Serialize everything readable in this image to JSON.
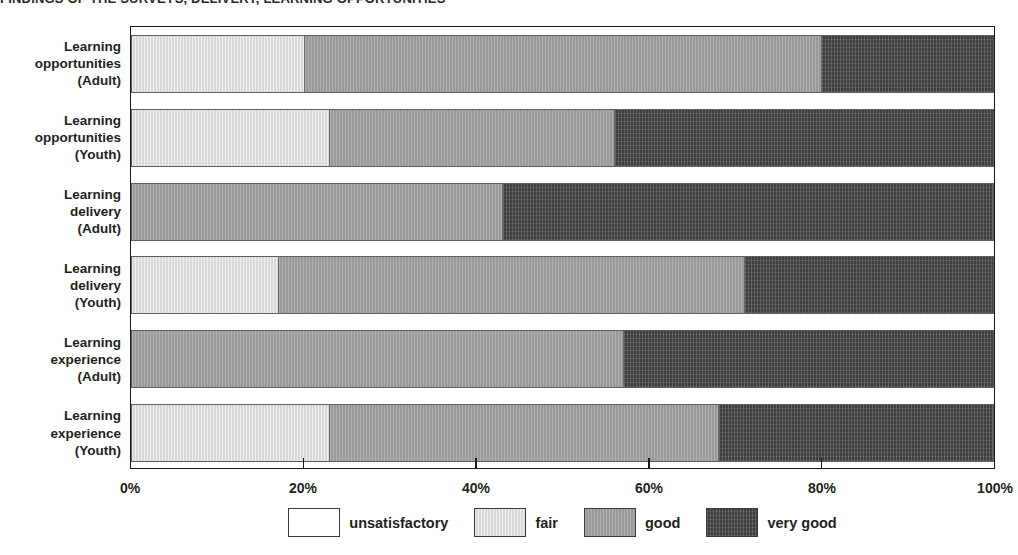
{
  "title": "FINDINGS OF THE SURVEYS, DELIVERY, LEARNING OPPORTUNITIES",
  "axis": {
    "ticks": [
      "0%",
      "20%",
      "40%",
      "60%",
      "80%",
      "100%"
    ],
    "tick_values": [
      0,
      20,
      40,
      60,
      80,
      100
    ],
    "xlabel": "",
    "ylabel": ""
  },
  "legend": {
    "position": "bottom-center",
    "items": [
      {
        "label": "unsatisfactory",
        "color": "#ffffff",
        "key": "unsatisfactory"
      },
      {
        "label": "fair",
        "color": "#d9d9d9",
        "key": "fair"
      },
      {
        "label": "good",
        "color": "#9a9a9a",
        "key": "good"
      },
      {
        "label": "very good",
        "color": "#3d3d3d",
        "key": "verygood"
      }
    ]
  },
  "categories": [
    {
      "line1": "Learning",
      "line2": "opportunities",
      "line3": "(Adult)"
    },
    {
      "line1": "Learning",
      "line2": "opportunities",
      "line3": "(Youth)"
    },
    {
      "line1": "Learning",
      "line2": "delivery",
      "line3": "(Adult)"
    },
    {
      "line1": "Learning",
      "line2": "delivery",
      "line3": "(Youth)"
    },
    {
      "line1": "Learning",
      "line2": "experience",
      "line3": "(Adult)"
    },
    {
      "line1": "Learning",
      "line2": "experience",
      "line3": "(Youth)"
    }
  ],
  "chart_data": {
    "type": "bar",
    "orientation": "horizontal",
    "stacked": true,
    "stacked_percent": true,
    "title": "FINDINGS OF THE SURVEYS, DELIVERY, LEARNING OPPORTUNITIES",
    "xlabel": "",
    "ylabel": "",
    "xlim": [
      0,
      100
    ],
    "grid": false,
    "categories": [
      "Learning opportunities (Adult)",
      "Learning opportunities (Youth)",
      "Learning delivery (Adult)",
      "Learning delivery (Youth)",
      "Learning experience (Adult)",
      "Learning experience (Youth)"
    ],
    "series": [
      {
        "name": "unsatisfactory",
        "color": "#ffffff",
        "values": [
          0,
          0,
          0,
          0,
          0,
          0
        ]
      },
      {
        "name": "fair",
        "color": "#d9d9d9",
        "values": [
          20,
          23,
          0,
          17,
          0,
          23
        ]
      },
      {
        "name": "good",
        "color": "#9a9a9a",
        "values": [
          60,
          33,
          43,
          54,
          57,
          45
        ]
      },
      {
        "name": "very good",
        "color": "#3d3d3d",
        "values": [
          20,
          44,
          57,
          29,
          43,
          32
        ]
      }
    ]
  }
}
